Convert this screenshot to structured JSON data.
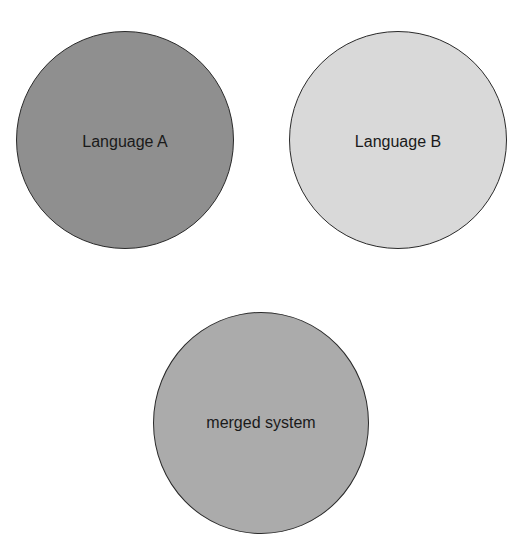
{
  "diagram": {
    "nodes": [
      {
        "id": "a",
        "label": "Language A",
        "fill": "#8f8f8f",
        "cx": 125,
        "cy": 140,
        "r": 109
      },
      {
        "id": "b",
        "label": "Language B",
        "fill": "#d9d9d9",
        "cx": 397,
        "cy": 140,
        "r": 109
      },
      {
        "id": "c",
        "label": "merged system",
        "fill": "#ababab",
        "cx": 260,
        "cy": 423,
        "r": 108
      }
    ]
  }
}
